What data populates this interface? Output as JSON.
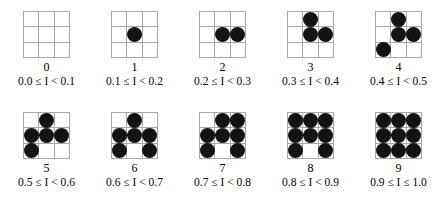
{
  "figure": {
    "title": "",
    "grid_line_color": "#a9a9a9",
    "dot_color": "#121212",
    "background_color": "#ffffff"
  },
  "chart_data": {
    "type": "table",
    "title": "",
    "xlabel": "",
    "ylabel": "",
    "categories": [
      "0",
      "1",
      "2",
      "3",
      "4",
      "5",
      "6",
      "7",
      "8",
      "9"
    ],
    "values": [
      0,
      1,
      2,
      3,
      4,
      5,
      6,
      7,
      8,
      9
    ],
    "series": [
      {
        "name": "dot count",
        "values": [
          0,
          1,
          2,
          3,
          4,
          5,
          6,
          7,
          8,
          9
        ]
      }
    ],
    "annotations": [
      "0.0 ≤ I < 0.1",
      "0.1 ≤ I < 0.2",
      "0.2 ≤ I < 0.3",
      "0.3 ≤ I < 0.4",
      "0.4 ≤ I < 0.5",
      "0.5 ≤ I < 0.6",
      "0.6 ≤ I < 0.7",
      "0.7 ≤ I < 0.8",
      "0.8 ≤ I < 0.9",
      "0.9 ≤ I ≤ 1.0"
    ]
  },
  "rows": [
    {
      "items": [
        {
          "digit": "0",
          "range": "0.0 ≤ I < 0.1",
          "count": 0,
          "pattern": [
            0,
            0,
            0,
            0,
            0,
            0,
            0,
            0,
            0
          ]
        },
        {
          "digit": "1",
          "range": "0.1 ≤ I < 0.2",
          "count": 1,
          "pattern": [
            0,
            0,
            0,
            0,
            1,
            0,
            0,
            0,
            0
          ]
        },
        {
          "digit": "2",
          "range": "0.2 ≤ I < 0.3",
          "count": 2,
          "pattern": [
            0,
            0,
            0,
            0,
            1,
            1,
            0,
            0,
            0
          ]
        },
        {
          "digit": "3",
          "range": "0.3 ≤ I < 0.4",
          "count": 3,
          "pattern": [
            0,
            1,
            0,
            0,
            1,
            1,
            0,
            0,
            0
          ]
        },
        {
          "digit": "4",
          "range": "0.4 ≤ I < 0.5",
          "count": 4,
          "pattern": [
            0,
            1,
            0,
            0,
            1,
            1,
            1,
            0,
            0
          ]
        }
      ]
    },
    {
      "items": [
        {
          "digit": "5",
          "range": "0.5 ≤ I < 0.6",
          "count": 5,
          "pattern": [
            0,
            1,
            0,
            1,
            1,
            1,
            1,
            0,
            0
          ]
        },
        {
          "digit": "6",
          "range": "0.6 ≤ I < 0.7",
          "count": 6,
          "pattern": [
            0,
            1,
            0,
            1,
            1,
            1,
            1,
            0,
            1
          ]
        },
        {
          "digit": "7",
          "range": "0.7 ≤ I < 0.8",
          "count": 7,
          "pattern": [
            0,
            1,
            1,
            1,
            1,
            1,
            1,
            0,
            1
          ]
        },
        {
          "digit": "8",
          "range": "0.8 ≤ I < 0.9",
          "count": 8,
          "pattern": [
            1,
            1,
            1,
            1,
            1,
            1,
            1,
            0,
            1
          ]
        },
        {
          "digit": "9",
          "range": "0.9 ≤ I ≤ 1.0",
          "count": 9,
          "pattern": [
            1,
            1,
            1,
            1,
            1,
            1,
            1,
            1,
            1
          ]
        }
      ]
    }
  ]
}
